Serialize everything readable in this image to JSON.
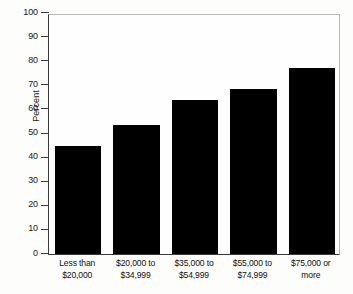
{
  "chart_data": {
    "type": "bar",
    "title": "",
    "subtitle": "",
    "xlabel": "",
    "ylabel": "Percent",
    "ylim": [
      0,
      100
    ],
    "ytick_step": 10,
    "grid": false,
    "legend": null,
    "bar_color": "#000000",
    "axis_color": "#3a3a3a",
    "categories": [
      "Less than\n$20,000",
      "$20,000 to\n$34,999",
      "$35,000 to\n$54,999",
      "$55,000 to\n$74,999",
      "$75,000 or\nmore"
    ],
    "category_lines": [
      [
        "Less than",
        "$20,000"
      ],
      [
        "$20,000 to",
        "$34,999"
      ],
      [
        "$35,000 to",
        "$54,999"
      ],
      [
        "$55,000 to",
        "$74,999"
      ],
      [
        "$75,000 or",
        "more"
      ]
    ],
    "values": [
      44.8,
      53.7,
      64.0,
      68.5,
      77.0
    ],
    "ytick_labels": [
      "100",
      "90",
      "80",
      "70",
      "60",
      "50",
      "40",
      "30",
      "20",
      "10",
      "0"
    ],
    "ytick_values": [
      100,
      90,
      80,
      70,
      60,
      50,
      40,
      30,
      20,
      10,
      0
    ]
  }
}
